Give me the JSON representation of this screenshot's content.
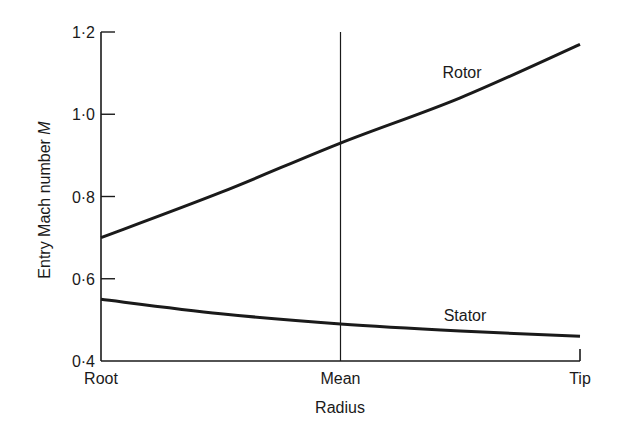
{
  "chart_data": {
    "type": "line",
    "title": "",
    "xlabel": "Radius",
    "ylabel": "Entry Mach number M",
    "ylabel_text": "Entry Mach number ",
    "ylabel_symbol": "M",
    "x": [
      "Root",
      "Quarter",
      "Mean",
      "Three-quarter",
      "Tip"
    ],
    "x_positions": [
      0,
      0.25,
      0.5,
      0.75,
      1.0
    ],
    "x_tick_labels": [
      "Root",
      "Mean",
      "Tip"
    ],
    "y_ticks": [
      0.4,
      0.6,
      0.8,
      1.0,
      1.2
    ],
    "y_tick_labels": [
      "0·4",
      "0·6",
      "0·8",
      "1·0",
      "1·2"
    ],
    "ylim": [
      0.4,
      1.2
    ],
    "grid": false,
    "legend": "inline labels",
    "annotations": [
      {
        "type": "vertical-line",
        "at": "Mean"
      }
    ],
    "series": [
      {
        "name": "Rotor",
        "values": [
          0.7,
          0.81,
          0.93,
          1.04,
          1.17
        ]
      },
      {
        "name": "Stator",
        "values": [
          0.55,
          0.515,
          0.49,
          0.473,
          0.46
        ]
      }
    ]
  }
}
